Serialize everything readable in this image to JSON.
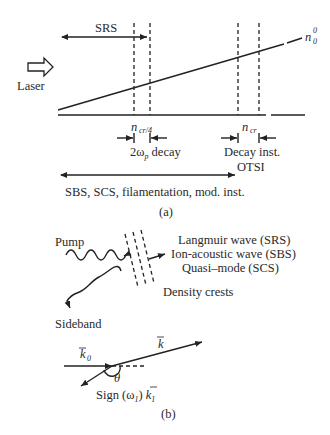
{
  "panel_a": {
    "laser_label": "Laser",
    "srs_label": "SRS",
    "density_label": "n",
    "density_sub": "0",
    "density_sup": "0",
    "ncr4_label": "n",
    "ncr4_sub": "cr/4",
    "ncr_label": "n",
    "ncr_sub": "cr",
    "decay2wp_pre": "2ω",
    "decay2wp_sub": "p",
    "decay2wp_post": " decay",
    "decay_inst_label": "Decay inst.",
    "otsi_label": "OTSI",
    "broad_label": "SBS, SCS, filamentation, mod. inst.",
    "caption": "(a)"
  },
  "panel_b": {
    "pump_label": "Pump",
    "sideband_label": "Sideband",
    "waves": [
      "Langmuir wave (SRS)",
      "Ion-acoustic wave (SBS)",
      "Quasi–mode (SCS)"
    ],
    "density_crests_label": "Density crests",
    "k0_label": "k",
    "k0_sub": "0",
    "k_label": "k",
    "theta_label": "θ",
    "sign_label": "Sign (ω",
    "sign_sub": "1",
    "sign_post": ") ",
    "k1_label": "k",
    "k1_sub": "1",
    "caption": "(b)"
  }
}
